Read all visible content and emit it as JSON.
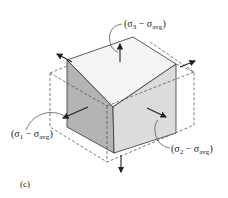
{
  "figure": {
    "caption": "(c)",
    "labels": {
      "sigma3": "(σ3 − σavg)",
      "sigma1": "(σ1 − σavg)",
      "sigma2": "(σ2 − σavg)"
    },
    "parts": {
      "sigma3": {
        "open": "(σ",
        "sub1": "3",
        "mid": " − σ",
        "sub2": "avg",
        "close": ")"
      },
      "sigma1": {
        "open": "(σ",
        "sub1": "1",
        "mid": " − σ",
        "sub2": "avg",
        "close": ")"
      },
      "sigma2": {
        "open": "(σ",
        "sub1": "2",
        "mid": " − σ",
        "sub2": "avg",
        "close": ")"
      }
    },
    "colors": {
      "top_face": "#f4f4f4",
      "left_face": "#b4b4b4",
      "right_face": "#dcdcdc",
      "stroke": "#333333"
    }
  }
}
